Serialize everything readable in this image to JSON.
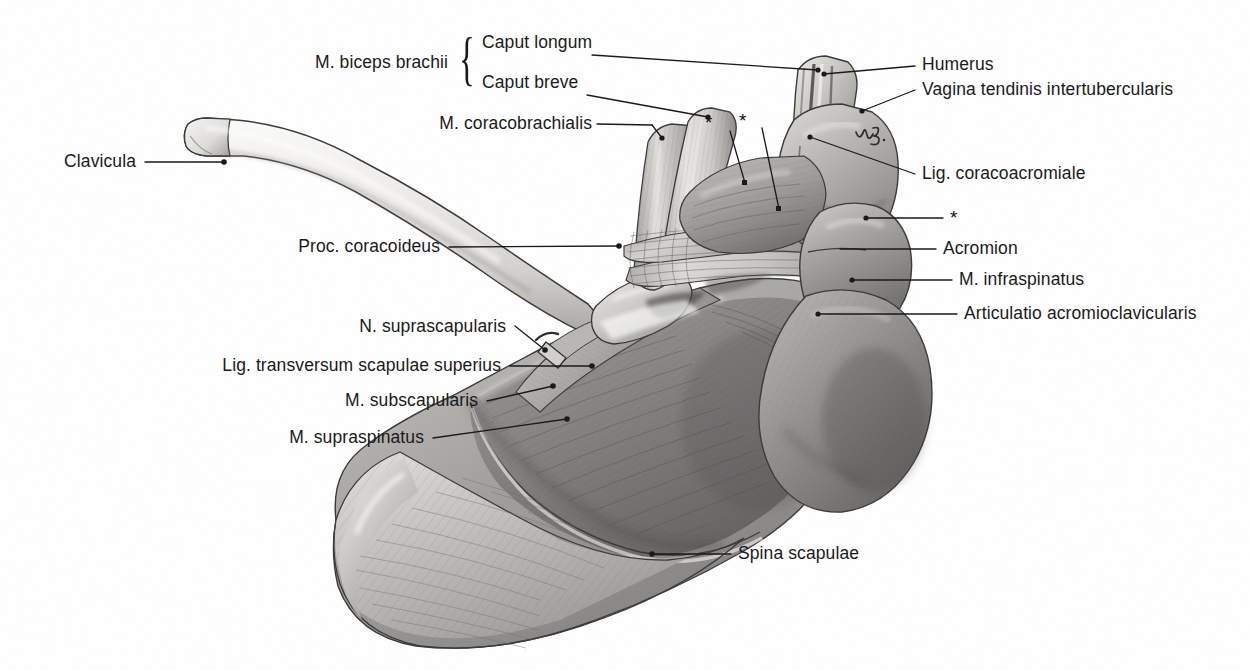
{
  "figure": {
    "style": "graphite pencil anatomical drawing",
    "background": "#ffffff",
    "ink_color": "#1a1a1a"
  },
  "brace": {
    "glyph": "{",
    "groups_label": "M. biceps brachii"
  },
  "labels": [
    {
      "id": "m-biceps-brachii",
      "text": "M. biceps brachii",
      "align": "right",
      "x": 448,
      "y": 62,
      "leader": false
    },
    {
      "id": "caput-longum",
      "text": "Caput longum",
      "align": "left",
      "x": 482,
      "y": 42,
      "leader": true
    },
    {
      "id": "caput-breve",
      "text": "Caput breve",
      "align": "left",
      "x": 482,
      "y": 82,
      "leader": true
    },
    {
      "id": "m-coracobrachialis",
      "text": "M. coracobrachialis",
      "align": "right",
      "x": 592,
      "y": 113,
      "leader": true
    },
    {
      "id": "clavicula",
      "text": "Clavicula",
      "align": "right",
      "x": 136,
      "y": 151,
      "leader": true
    },
    {
      "id": "proc-coracoideus",
      "text": "Proc. coracoideus",
      "align": "right",
      "x": 440,
      "y": 236,
      "leader": true
    },
    {
      "id": "n-suprascapularis",
      "text": "N. suprascapularis",
      "align": "right",
      "x": 506,
      "y": 316,
      "leader": true
    },
    {
      "id": "lig-transversum",
      "text": "Lig. transversum scapulae superius",
      "align": "right",
      "x": 501,
      "y": 355,
      "leader": true
    },
    {
      "id": "m-subscapularis",
      "text": "M. subscapularis",
      "align": "right",
      "x": 478,
      "y": 390,
      "leader": true
    },
    {
      "id": "m-supraspinatus",
      "text": "M. supraspinatus",
      "align": "right",
      "x": 424,
      "y": 427,
      "leader": true
    },
    {
      "id": "humerus",
      "text": "Humerus",
      "align": "left",
      "x": 922,
      "y": 54,
      "leader": true
    },
    {
      "id": "vagina-tendinis",
      "text": "Vagina tendinis intertubercularis",
      "align": "left",
      "x": 922,
      "y": 79,
      "leader": true
    },
    {
      "id": "lig-coracoacromiale",
      "text": "Lig. coracoacromiale",
      "align": "left",
      "x": 922,
      "y": 163,
      "leader": true
    },
    {
      "id": "asterisk-right",
      "text": "*",
      "align": "left",
      "x": 950,
      "y": 208,
      "leader": true
    },
    {
      "id": "acromion",
      "text": "Acromion",
      "align": "left",
      "x": 943,
      "y": 238,
      "leader": true
    },
    {
      "id": "m-infraspinatus",
      "text": "M. infraspinatus",
      "align": "left",
      "x": 959,
      "y": 269,
      "leader": true
    },
    {
      "id": "articulatio-ac",
      "text": "Articulatio acromioclavicularis",
      "align": "left",
      "x": 964,
      "y": 303,
      "leader": true
    },
    {
      "id": "spina-scapulae",
      "text": "Spina scapulae",
      "align": "left",
      "x": 738,
      "y": 543,
      "leader": true
    }
  ],
  "asterisks": [
    {
      "id": "asterisk-1",
      "text": "*",
      "x": 709,
      "y": 120
    },
    {
      "id": "asterisk-2",
      "text": "*",
      "x": 743,
      "y": 118
    }
  ],
  "annotation_mark": {
    "id": "pencil-initials",
    "note": "handwritten pencil initials on humeral head"
  },
  "palette": {
    "bone_light": "#f2f1ef",
    "bone_mid": "#d8d6d3",
    "muscle_mid": "#b4b2b0",
    "muscle_dark": "#8d8b89",
    "shadow": "#6a6967",
    "deep_shadow": "#4a4948",
    "outline": "#2a2a2a"
  }
}
